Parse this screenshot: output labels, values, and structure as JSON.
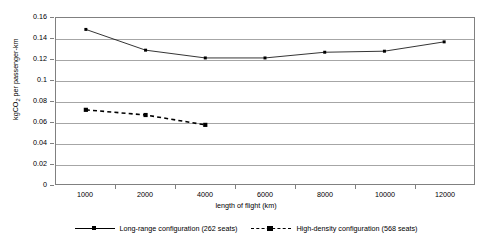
{
  "chart_data": {
    "type": "line",
    "title": "",
    "xlabel": "length of flight (km)",
    "ylabel": "kgCO2 per passenger-km",
    "ylabel_main": "kgCO",
    "ylabel_sub": "2",
    "ylabel_tail": " per passenger-km",
    "categories": [
      "1000",
      "2000",
      "4000",
      "6000",
      "8000",
      "10000",
      "12000"
    ],
    "ylim": [
      0,
      0.16
    ],
    "ytick_labels": [
      "0.16",
      "0.14",
      "0.12",
      "0.1",
      "0.08",
      "0.06",
      "0.04",
      "0.02",
      "0"
    ],
    "ytick_values": [
      0.16,
      0.14,
      0.12,
      0.1,
      0.08,
      0.06,
      0.04,
      0.02,
      0
    ],
    "grid": true,
    "legend_position": "bottom",
    "series": [
      {
        "name": "Long-range configuration  (262 seats)",
        "style": "solid",
        "marker": "square-small",
        "color": "#000000",
        "values": [
          0.149,
          0.129,
          0.1215,
          0.1215,
          0.127,
          0.128,
          0.137
        ]
      },
      {
        "name": "High-density configuration (568 seats)",
        "style": "dashed",
        "marker": "square",
        "color": "#000000",
        "values": [
          0.0715,
          0.0665,
          0.057,
          null,
          null,
          null,
          null
        ]
      }
    ]
  }
}
